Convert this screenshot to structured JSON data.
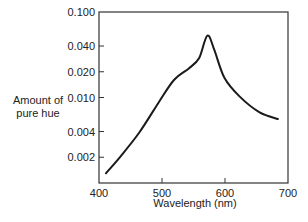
{
  "chart_data": {
    "type": "line",
    "title": "",
    "xlabel": "Wavelength (nm)",
    "ylabel": "Amount of pure hue",
    "ylabel_lines": [
      "Amount of",
      "pure hue"
    ],
    "xlim": [
      400,
      700
    ],
    "ylim": [
      0.001,
      0.1
    ],
    "yscale": "log",
    "grid": false,
    "legend": null,
    "x_ticks": [
      400,
      500,
      600,
      700
    ],
    "x_tick_labels": [
      "400",
      "500",
      "600",
      "700"
    ],
    "y_ticks": [
      0.1,
      0.04,
      0.02,
      0.01,
      0.004,
      0.002
    ],
    "y_tick_labels": [
      "0.100",
      "0.040",
      "0.020",
      "0.010",
      "0.004",
      "0.002"
    ],
    "series": [
      {
        "name": "pure hue",
        "x": [
          411,
          433,
          464,
          495,
          519,
          543,
          559,
          572,
          583,
          599,
          623,
          655,
          684
        ],
        "y": [
          0.0013,
          0.002,
          0.0039,
          0.0088,
          0.016,
          0.022,
          0.029,
          0.053,
          0.036,
          0.017,
          0.0103,
          0.0067,
          0.0056
        ]
      }
    ]
  },
  "style": {
    "line_color": "#1a1a1a",
    "axis_color": "#333333",
    "background": "#ffffff"
  }
}
